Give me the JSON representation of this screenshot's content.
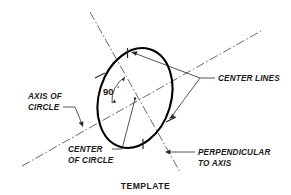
{
  "figure": {
    "caption": "TEMPLATE",
    "angle_value": "90",
    "angle_unit": "°",
    "labels": {
      "center_lines": "CENTER LINES",
      "axis_of_circle_line1": "AXIS OF",
      "axis_of_circle_line2": "CIRCLE",
      "center_of_circle_line1": "CENTER",
      "center_of_circle_line2": "OF CIRCLE",
      "perpendicular_line1": "PERPENDICULAR",
      "perpendicular_line2": "TO AXIS"
    },
    "colors": {
      "ink": "#1a1a1a",
      "outline": "#000000",
      "thin_line": "#2b2b2b",
      "center_line": "#4a4a4a",
      "background": "#ffffff"
    }
  }
}
